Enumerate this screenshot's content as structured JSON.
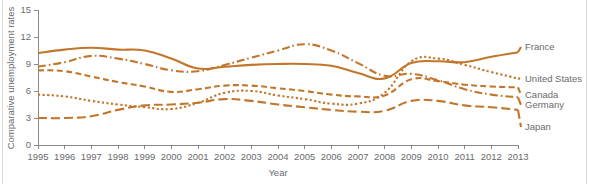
{
  "figure": {
    "background": "#ffffff",
    "edge_rule_color": "#d9d9d9",
    "axis_color": "#8a8a8a",
    "text_color": "#6b6b6b",
    "series_color": "#C1762B"
  },
  "chart_data": {
    "type": "line",
    "title": "",
    "xlabel": "Year",
    "ylabel": "Comparative unemployment rates",
    "xlim": [
      1995,
      2013
    ],
    "ylim": [
      0,
      15
    ],
    "yticks": [
      0,
      3,
      6,
      9,
      12,
      15
    ],
    "ytick_labels": [
      "0",
      "3",
      "6",
      "9",
      "12",
      "15"
    ],
    "x": [
      1995,
      1996,
      1997,
      1998,
      1999,
      2000,
      2001,
      2002,
      2003,
      2004,
      2005,
      2006,
      2007,
      2008,
      2009,
      2010,
      2011,
      2012,
      2013
    ],
    "xtick_labels": [
      "1995",
      "1996",
      "1997",
      "1998",
      "1999",
      "2000",
      "2001",
      "2002",
      "2003",
      "2004",
      "2005",
      "2006",
      "2007",
      "2008",
      "2009",
      "2010",
      "2011",
      "2012",
      "2013"
    ],
    "grid": false,
    "legend_position": "right-inline",
    "series": [
      {
        "name": "France",
        "label": "France",
        "color": "#C1762B",
        "dash": "none",
        "dasharray": "",
        "values": [
          10.2,
          10.6,
          10.8,
          10.6,
          10.5,
          9.6,
          8.5,
          8.7,
          8.9,
          9.0,
          9.0,
          8.8,
          8.0,
          7.4,
          9.1,
          9.3,
          9.2,
          9.8,
          10.3
        ]
      },
      {
        "name": "United States",
        "label": "United States",
        "color": "#C1762B",
        "dash": "dotted",
        "dasharray": "2.2,2.4",
        "values": [
          5.6,
          5.4,
          4.9,
          4.5,
          4.2,
          4.0,
          4.7,
          5.8,
          6.0,
          5.5,
          5.1,
          4.6,
          4.6,
          5.8,
          9.3,
          9.6,
          8.9,
          8.1,
          7.4
        ]
      },
      {
        "name": "Canada",
        "label": "Canada",
        "color": "#C1762B",
        "dash": "dashed",
        "dasharray": "6,3.4",
        "values": [
          8.3,
          8.2,
          7.6,
          7.0,
          6.5,
          5.9,
          6.2,
          6.6,
          6.6,
          6.3,
          6.0,
          5.6,
          5.4,
          5.5,
          7.3,
          7.1,
          6.7,
          6.5,
          6.4
        ]
      },
      {
        "name": "Germany",
        "label": "Germany",
        "color": "#C1762B",
        "dash": "dashdot",
        "dasharray": "8,3,1.6,3",
        "values": [
          8.7,
          9.2,
          9.9,
          9.6,
          9.0,
          8.3,
          8.2,
          8.9,
          9.7,
          10.5,
          11.2,
          10.5,
          9.1,
          7.7,
          7.9,
          7.2,
          6.2,
          5.6,
          5.3
        ]
      },
      {
        "name": "Japan",
        "label": "Japan",
        "color": "#C1762B",
        "dash": "longdash",
        "dasharray": "9,4",
        "values": [
          3.0,
          3.0,
          3.2,
          3.9,
          4.4,
          4.5,
          4.7,
          5.1,
          4.9,
          4.5,
          4.2,
          3.9,
          3.7,
          3.8,
          4.9,
          4.9,
          4.4,
          4.2,
          3.9
        ]
      }
    ]
  },
  "legend": {
    "entries": [
      {
        "label": "France"
      },
      {
        "label": "United States"
      },
      {
        "label": "Canada"
      },
      {
        "label": "Germany"
      },
      {
        "label": "Japan"
      }
    ]
  }
}
